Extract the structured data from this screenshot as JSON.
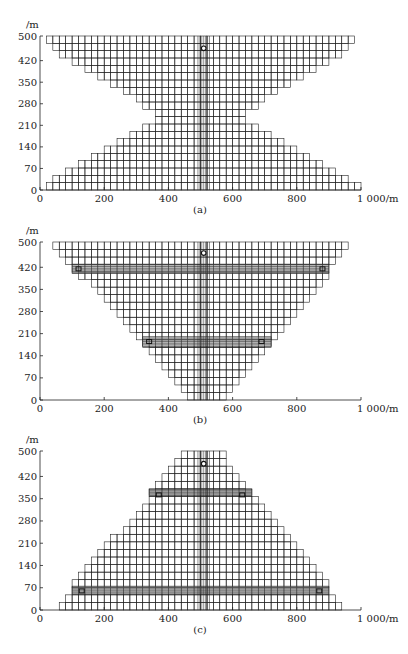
{
  "figure": {
    "panels": [
      {
        "id": "a",
        "caption": "(a)",
        "y_unit_label": "/m",
        "x_unit_label": "1 000/m",
        "x_ticks": [
          "0",
          "200",
          "400",
          "600",
          "800"
        ],
        "y_ticks": [
          "0",
          "70",
          "140",
          "210",
          "280",
          "350",
          "420",
          "500"
        ],
        "shape": "hourglass",
        "profile_rows": [
          [
            20,
            1000
          ],
          [
            40,
            960
          ],
          [
            80,
            920
          ],
          [
            120,
            880
          ],
          [
            160,
            840
          ],
          [
            200,
            800
          ],
          [
            240,
            760
          ],
          [
            280,
            720
          ],
          [
            320,
            680
          ],
          [
            360,
            640
          ],
          [
            360,
            640
          ],
          [
            320,
            680
          ],
          [
            300,
            700
          ],
          [
            260,
            740
          ],
          [
            220,
            780
          ],
          [
            180,
            820
          ],
          [
            140,
            860
          ],
          [
            100,
            900
          ],
          [
            60,
            940
          ],
          [
            40,
            960
          ],
          [
            20,
            980
          ]
        ],
        "highlight_rows": [],
        "markers": [
          {
            "x": 510,
            "y": 460,
            "shape": "circle"
          }
        ]
      },
      {
        "id": "b",
        "caption": "(b)",
        "y_unit_label": "/m",
        "x_unit_label": "1 000/m",
        "x_ticks": [
          "0",
          "200",
          "400",
          "600",
          "800"
        ],
        "y_ticks": [
          "0",
          "70",
          "140",
          "210",
          "280",
          "350",
          "420",
          "500"
        ],
        "shape": "inverted-triangle",
        "profile_rows": [
          [
            460,
            580
          ],
          [
            440,
            600
          ],
          [
            420,
            620
          ],
          [
            400,
            640
          ],
          [
            380,
            660
          ],
          [
            360,
            680
          ],
          [
            340,
            700
          ],
          [
            320,
            720
          ],
          [
            300,
            740
          ],
          [
            280,
            760
          ],
          [
            260,
            780
          ],
          [
            240,
            800
          ],
          [
            220,
            820
          ],
          [
            200,
            840
          ],
          [
            180,
            860
          ],
          [
            160,
            880
          ],
          [
            120,
            900
          ],
          [
            100,
            900
          ],
          [
            80,
            920
          ],
          [
            60,
            940
          ],
          [
            40,
            960
          ]
        ],
        "highlight_rows": [
          {
            "y_min": 170,
            "y_max": 200,
            "x_min": 320,
            "x_max": 720
          },
          {
            "y_min": 400,
            "y_max": 430,
            "x_min": 100,
            "x_max": 900
          }
        ],
        "markers": [
          {
            "x": 510,
            "y": 465,
            "shape": "circle"
          },
          {
            "x": 120,
            "y": 415,
            "shape": "square"
          },
          {
            "x": 880,
            "y": 415,
            "shape": "square"
          },
          {
            "x": 340,
            "y": 185,
            "shape": "square"
          },
          {
            "x": 690,
            "y": 185,
            "shape": "square"
          }
        ]
      },
      {
        "id": "c",
        "caption": "(c)",
        "y_unit_label": "/m",
        "x_unit_label": "1 000/m",
        "x_ticks": [
          "0",
          "200",
          "400",
          "600",
          "800"
        ],
        "y_ticks": [
          "0",
          "70",
          "140",
          "210",
          "280",
          "350",
          "420",
          "500"
        ],
        "shape": "triangle",
        "profile_rows": [
          [
            60,
            940
          ],
          [
            80,
            920
          ],
          [
            100,
            900
          ],
          [
            100,
            900
          ],
          [
            120,
            880
          ],
          [
            140,
            860
          ],
          [
            160,
            840
          ],
          [
            180,
            820
          ],
          [
            200,
            800
          ],
          [
            220,
            780
          ],
          [
            260,
            760
          ],
          [
            280,
            740
          ],
          [
            300,
            720
          ],
          [
            320,
            700
          ],
          [
            340,
            680
          ],
          [
            340,
            660
          ],
          [
            360,
            640
          ],
          [
            380,
            620
          ],
          [
            400,
            600
          ],
          [
            420,
            580
          ],
          [
            440,
            580
          ]
        ],
        "highlight_rows": [
          {
            "y_min": 50,
            "y_max": 75,
            "x_min": 100,
            "x_max": 900
          },
          {
            "y_min": 360,
            "y_max": 380,
            "x_min": 340,
            "x_max": 660
          }
        ],
        "markers": [
          {
            "x": 510,
            "y": 460,
            "shape": "circle"
          },
          {
            "x": 130,
            "y": 60,
            "shape": "square"
          },
          {
            "x": 870,
            "y": 60,
            "shape": "square"
          },
          {
            "x": 370,
            "y": 362,
            "shape": "square"
          },
          {
            "x": 630,
            "y": 362,
            "shape": "square"
          }
        ]
      }
    ]
  }
}
